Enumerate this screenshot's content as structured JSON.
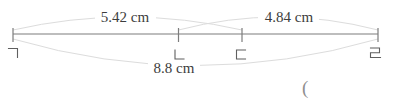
{
  "diagram": {
    "type": "overlapping-segments-number-line",
    "points": [
      {
        "name": "giyeok",
        "label": "ㄱ"
      },
      {
        "name": "nieun",
        "label": "ㄴ"
      },
      {
        "name": "digeut",
        "label": "ㄷ"
      },
      {
        "name": "rieul",
        "label": "ㄹ"
      }
    ],
    "measurements": [
      {
        "label": "5.42 cm",
        "value_cm": 5.42,
        "from": "ㄱ",
        "to": "ㄷ",
        "arc": "top"
      },
      {
        "label": "4.84 cm",
        "value_cm": 4.84,
        "from": "ㄴ",
        "to": "ㄹ",
        "arc": "top"
      },
      {
        "label": "8.8 cm",
        "value_cm": 8.8,
        "from": "ㄱ",
        "to": "ㄹ",
        "arc": "bottom"
      }
    ],
    "answer_prefix": "("
  },
  "colors": {
    "line": "#7d7d7d",
    "arc": "#dcdcdc",
    "measurement_text": "#3d3d3d",
    "point_label": "#5f5f5f",
    "paren": "#8f8f8f",
    "background": "#ffffff"
  }
}
